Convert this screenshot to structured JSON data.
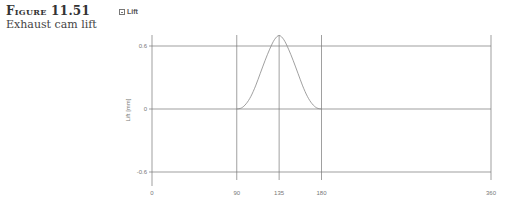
{
  "figure": {
    "number": "Figure 11.51",
    "title": "Exhaust cam lift"
  },
  "panel": {
    "title": "Lift",
    "icon": "collapse-icon"
  },
  "chart_data": {
    "type": "line",
    "title": "Lift",
    "xlabel": "",
    "ylabel": "Lift [mm]",
    "xlim": [
      0,
      360
    ],
    "ylim": [
      -0.6,
      0.6
    ],
    "x_ticks": [
      0,
      90,
      135,
      180,
      360
    ],
    "y_ticks": [
      0.6,
      0,
      -0.6
    ],
    "grid": true,
    "series": [
      {
        "name": "Exhaust cam lift",
        "x": [
          0,
          90,
          95,
          100,
          105,
          110,
          115,
          120,
          125,
          130,
          135,
          140,
          145,
          150,
          155,
          160,
          165,
          170,
          175,
          180,
          360
        ],
        "values": [
          0,
          0,
          0.01,
          0.05,
          0.12,
          0.22,
          0.34,
          0.46,
          0.57,
          0.66,
          0.7,
          0.66,
          0.57,
          0.46,
          0.34,
          0.22,
          0.12,
          0.05,
          0.01,
          0,
          0
        ]
      }
    ],
    "line_color": "#888888",
    "grid_color": "#777777"
  }
}
